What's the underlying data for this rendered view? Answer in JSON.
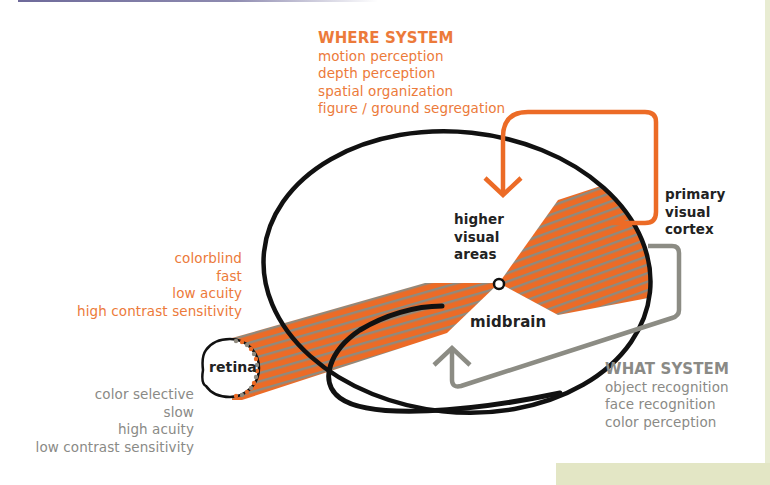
{
  "colors": {
    "orange": "#ec6b26",
    "orange_text": "#ec7a3a",
    "fiber_gray": "#8f8a7e",
    "gray_text": "#8a8a86",
    "arrow_gray": "#8c8c84",
    "outline": "#111111",
    "panel_green": "#e3e6c5"
  },
  "where_system": {
    "title": "WHERE SYSTEM",
    "items": [
      "motion perception",
      "depth perception",
      "spatial organization",
      "figure / ground segregation"
    ]
  },
  "what_system": {
    "title": "WHAT SYSTEM",
    "items": [
      "object recognition",
      "face recognition",
      "color perception"
    ]
  },
  "magno_properties": [
    "colorblind",
    "fast",
    "low acuity",
    "high contrast sensitivity"
  ],
  "parvo_properties": [
    "color selective",
    "slow",
    "high acuity",
    "low contrast sensitivity"
  ],
  "labels": {
    "retina": "retina",
    "midbrain": "midbrain",
    "higher_visual_areas": [
      "higher",
      "visual",
      "areas"
    ],
    "primary_visual_cortex": [
      "primary",
      "visual",
      "cortex"
    ]
  }
}
